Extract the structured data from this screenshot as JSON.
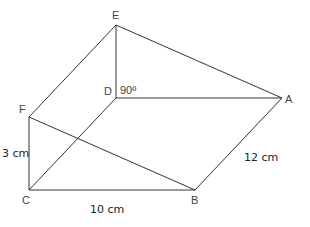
{
  "figure": {
    "type": "3d-prism-wireframe",
    "stroke_color": "#333333",
    "vertices": {
      "E": {
        "label": "E",
        "x": 116,
        "y": 25
      },
      "D": {
        "label": "D",
        "x": 116,
        "y": 98
      },
      "F": {
        "label": "F",
        "x": 29,
        "y": 117
      },
      "C": {
        "label": "C",
        "x": 29,
        "y": 190
      },
      "A": {
        "label": "A",
        "x": 282,
        "y": 98
      },
      "B": {
        "label": "B",
        "x": 195,
        "y": 190
      }
    },
    "edges": [
      [
        "E",
        "D"
      ],
      [
        "E",
        "A"
      ],
      [
        "E",
        "F"
      ],
      [
        "D",
        "A"
      ],
      [
        "D",
        "C"
      ],
      [
        "F",
        "C"
      ],
      [
        "F",
        "B"
      ],
      [
        "C",
        "B"
      ],
      [
        "B",
        "A"
      ]
    ],
    "angle_label": "90º",
    "measurements": {
      "FC": "3 cm",
      "CB": "10 cm",
      "BA": "12 cm"
    }
  }
}
